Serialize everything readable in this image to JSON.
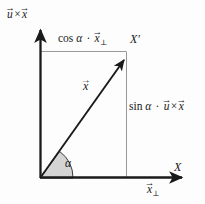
{
  "figure": {
    "type": "vector-decomposition-diagram",
    "background_color": "#fdfdfd",
    "stroke_color": "#1a1a1a",
    "guide_color": "#8c8c8c",
    "sector_fill": "#d4d4d4",
    "sector_stroke": "#3a3a3a"
  },
  "labels": {
    "vertical_axis": {
      "parts": {
        "first": "u",
        "op": "×",
        "second": "x"
      },
      "text": "u⃗ × x⃗"
    },
    "horizontal_axis": {
      "text": "X"
    },
    "horizontal_component": {
      "parts": {
        "base": "x",
        "sub": "⊥"
      },
      "text": "x⃗⊥"
    },
    "top_projection": {
      "parts": {
        "fn": "cos",
        "angle": "α",
        "dot": "·",
        "base": "x",
        "sub": "⊥"
      },
      "text": "cos α · x⃗⊥"
    },
    "right_projection": {
      "parts": {
        "fn": "sin",
        "angle": "α",
        "dot": "·",
        "first": "u",
        "op": "×",
        "second": "x"
      },
      "text": "sin α · u⃗ × x⃗"
    },
    "rotated_point": {
      "text": "X′"
    },
    "rotated_vector": {
      "parts": {
        "base": "x"
      },
      "text": "x⃗"
    },
    "angle": {
      "text": "α"
    }
  },
  "geometry": {
    "origin": {
      "x": 40,
      "y": 178
    },
    "x_prime": {
      "x": 126,
      "y": 58
    },
    "vertical_axis_top": {
      "x": 40,
      "y": 26
    },
    "horizontal_axis_right": {
      "x": 187,
      "y": 178
    },
    "sector_radius": 33,
    "angle_degrees": 54
  }
}
